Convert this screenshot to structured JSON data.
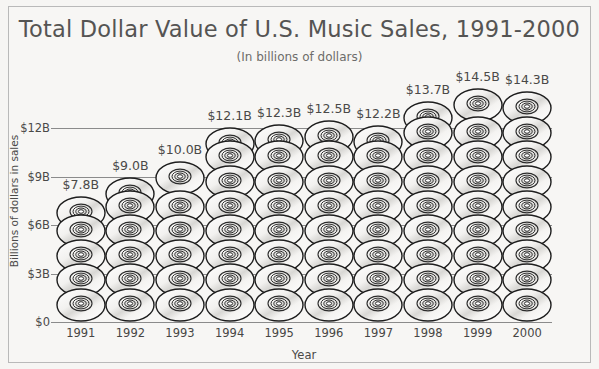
{
  "chart_data": {
    "type": "bar",
    "title": "Total Dollar Value of U.S. Music Sales, 1991-2000",
    "subtitle": "(In billions of dollars)",
    "xlabel": "Year",
    "ylabel": "Billions of dollars in sales",
    "categories": [
      "1991",
      "1992",
      "1993",
      "1994",
      "1995",
      "1996",
      "1997",
      "1998",
      "1999",
      "2000"
    ],
    "values": [
      7.8,
      9.0,
      10.0,
      12.1,
      12.3,
      12.5,
      12.2,
      13.7,
      14.5,
      14.3
    ],
    "data_labels": [
      "$7.8B",
      "$9.0B",
      "$10.0B",
      "$12.1B",
      "$12.3B",
      "$12.5B",
      "$12.2B",
      "$13.7B",
      "$14.5B",
      "$14.3B"
    ],
    "ylim": [
      0,
      15
    ],
    "yticks": [
      0,
      3,
      6,
      9,
      12
    ],
    "ytick_labels": [
      "$0",
      "$3B",
      "$6B",
      "$9B",
      "$12B"
    ],
    "grid": true,
    "legend": "none",
    "pictogram": "compact-disc",
    "marker_label": "cd-stack"
  },
  "style": {
    "text_color": "#4a4948",
    "title_color": "#555453",
    "grid_color": "#8b8b8b",
    "background": "#f7f6f4",
    "frame_color": "#b9b9b9",
    "disc_outline": "#222222",
    "disc_fill": "#ffffff"
  }
}
